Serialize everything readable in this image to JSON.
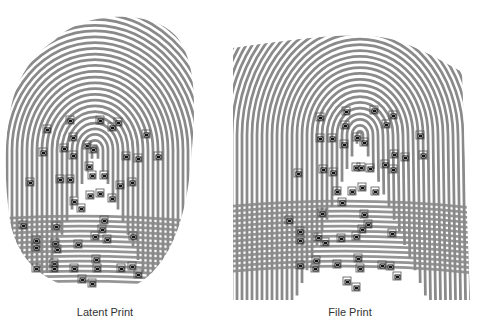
{
  "figure": {
    "left": {
      "caption": "Latent Print",
      "ridge_color": "#8a8a8a",
      "minutiae": [
        [
          70,
          120
        ],
        [
          100,
          120
        ],
        [
          118,
          122
        ],
        [
          112,
          127
        ],
        [
          47,
          129
        ],
        [
          73,
          137
        ],
        [
          146,
          134
        ],
        [
          43,
          152
        ],
        [
          64,
          148
        ],
        [
          73,
          155
        ],
        [
          87,
          145
        ],
        [
          93,
          149
        ],
        [
          126,
          156
        ],
        [
          138,
          158
        ],
        [
          158,
          156
        ],
        [
          89,
          166
        ],
        [
          92,
          175
        ],
        [
          104,
          175
        ],
        [
          60,
          179
        ],
        [
          70,
          179
        ],
        [
          30,
          182
        ],
        [
          120,
          185
        ],
        [
          132,
          182
        ],
        [
          74,
          201
        ],
        [
          81,
          208
        ],
        [
          90,
          195
        ],
        [
          100,
          193
        ],
        [
          112,
          198
        ],
        [
          104,
          220
        ],
        [
          23,
          225
        ],
        [
          56,
          226
        ],
        [
          102,
          229
        ],
        [
          95,
          236
        ],
        [
          107,
          239
        ],
        [
          133,
          236
        ],
        [
          78,
          244
        ],
        [
          36,
          240
        ],
        [
          36,
          247
        ],
        [
          55,
          243
        ],
        [
          57,
          249
        ],
        [
          54,
          263
        ],
        [
          54,
          268
        ],
        [
          96,
          259
        ],
        [
          97,
          268
        ],
        [
          36,
          268
        ],
        [
          74,
          268
        ],
        [
          121,
          268
        ],
        [
          132,
          266
        ],
        [
          138,
          274
        ],
        [
          82,
          279
        ],
        [
          92,
          283
        ]
      ]
    },
    "right": {
      "caption": "File Print",
      "ridge_color": "#8a8a8a",
      "minutiae": [
        [
          346,
          111
        ],
        [
          374,
          110
        ],
        [
          320,
          117
        ],
        [
          393,
          115
        ],
        [
          386,
          124
        ],
        [
          345,
          125
        ],
        [
          320,
          138
        ],
        [
          332,
          138
        ],
        [
          344,
          144
        ],
        [
          357,
          137
        ],
        [
          364,
          142
        ],
        [
          420,
          135
        ],
        [
          394,
          154
        ],
        [
          405,
          157
        ],
        [
          423,
          155
        ],
        [
          298,
          173
        ],
        [
          323,
          169
        ],
        [
          333,
          172
        ],
        [
          356,
          167
        ],
        [
          361,
          167
        ],
        [
          370,
          168
        ],
        [
          385,
          164
        ],
        [
          393,
          169
        ],
        [
          337,
          191
        ],
        [
          352,
          191
        ],
        [
          362,
          187
        ],
        [
          375,
          191
        ],
        [
          342,
          202
        ],
        [
          289,
          220
        ],
        [
          322,
          213
        ],
        [
          364,
          214
        ],
        [
          368,
          224
        ],
        [
          362,
          229
        ],
        [
          356,
          236
        ],
        [
          392,
          233
        ],
        [
          300,
          231
        ],
        [
          300,
          240
        ],
        [
          318,
          237
        ],
        [
          325,
          242
        ],
        [
          341,
          238
        ],
        [
          316,
          260
        ],
        [
          315,
          268
        ],
        [
          358,
          258
        ],
        [
          360,
          268
        ],
        [
          300,
          265
        ],
        [
          337,
          264
        ],
        [
          382,
          265
        ],
        [
          390,
          266
        ],
        [
          397,
          276
        ],
        [
          347,
          281
        ],
        [
          356,
          287
        ]
      ]
    }
  }
}
